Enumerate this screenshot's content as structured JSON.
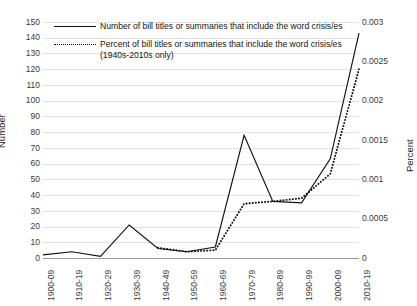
{
  "chart_data": {
    "type": "line",
    "title": "",
    "xlabel": "",
    "ylabel": "Number",
    "y2label": "Percent",
    "grid": true,
    "legend_position": "top-inside",
    "categories": [
      "1900-09",
      "1910-19",
      "1920-29",
      "1930-39",
      "1940-49",
      "1950-59",
      "1960-69",
      "1970-79",
      "1980-89",
      "1990-99",
      "2000-09",
      "2010-19"
    ],
    "ylim": [
      0,
      150
    ],
    "yticks": [
      0,
      10,
      20,
      30,
      40,
      50,
      60,
      70,
      80,
      90,
      100,
      110,
      120,
      130,
      140,
      150
    ],
    "y2lim": [
      0,
      0.003
    ],
    "y2ticks": [
      0,
      0.0005,
      0.001,
      0.0015,
      0.002,
      0.0025,
      0.003
    ],
    "y2ticklabels": [
      "0",
      "0.0005",
      "0.001",
      "0.0015",
      "0.002",
      "0.0025",
      "0.003"
    ],
    "series": [
      {
        "name": "Number of bill titles or summaries that include the word crisis/es",
        "axis": "left",
        "style": "solid",
        "values": [
          2,
          4,
          1,
          21,
          6,
          4,
          7,
          78,
          36,
          35,
          63,
          143
        ]
      },
      {
        "name": "Percent of bill titles or summaries that include the word crisis/es (1940s-2010s only)",
        "axis": "right",
        "style": "dotted",
        "values": [
          null,
          null,
          null,
          null,
          0.00013,
          8e-05,
          0.0001,
          0.00069,
          0.00072,
          0.00076,
          0.00107,
          0.0024
        ]
      }
    ]
  },
  "legend": {
    "entries": [
      {
        "marker": "solid-line",
        "line1": "Number of bill titles or summaries that include the word crisis/es",
        "line2": ""
      },
      {
        "marker": "dotted-line",
        "line1": "Percent of bill titles or summaries that include the word crisis/es",
        "line2": "(1940s-2010s only)"
      }
    ]
  },
  "axes": {
    "left_title": "Number",
    "right_title": "Percent"
  }
}
